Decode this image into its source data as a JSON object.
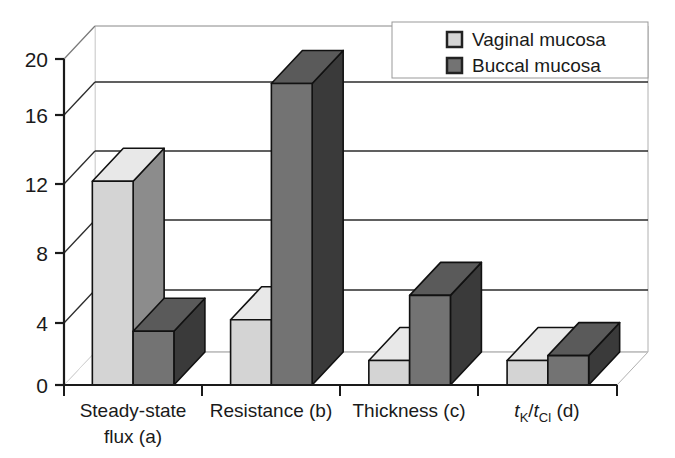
{
  "chart_data": {
    "type": "bar",
    "title": "",
    "subtitle": "",
    "xlabel": "",
    "ylabel": "",
    "ylim": [
      0,
      20
    ],
    "yticks": [
      0,
      4,
      8,
      12,
      16,
      20
    ],
    "ytick_labels": [
      "0",
      "4",
      "8",
      "12",
      "16",
      "20"
    ],
    "grid": true,
    "grid_axis": "y",
    "three_d": true,
    "legend_position": "top-right",
    "categories": [
      "Steady-state flux (a)",
      "Resistance (b)",
      "Thickness (c)",
      "tK/tCl (d)"
    ],
    "category_lines": [
      [
        "Steady-state",
        "flux (a)"
      ],
      [
        "Resistance (b)"
      ],
      [
        "Thickness (c)"
      ],
      [
        "tK/tCl (d)"
      ]
    ],
    "series": [
      {
        "name": "Vaginal mucosa",
        "color": "#d4d4d4",
        "side_color": "#8c8c8c",
        "top_color": "#e8e8e8",
        "values": [
          12.5,
          4.0,
          1.5,
          1.5
        ]
      },
      {
        "name": "Buccal mucosa",
        "color": "#737373",
        "side_color": "#3a3a3a",
        "top_color": "#5a5a5a",
        "values": [
          3.3,
          18.5,
          5.5,
          1.8
        ]
      }
    ]
  },
  "legend": {
    "items": [
      {
        "label": "Vaginal mucosa",
        "swatch_color": "#d4d4d4"
      },
      {
        "label": "Buccal mucosa",
        "swatch_color": "#737373"
      }
    ]
  },
  "axis": {
    "y_tick_labels": [
      "20",
      "16",
      "12",
      "8",
      "4",
      "0"
    ]
  },
  "category_labels": {
    "c0_line1": "Steady-state",
    "c0_line2": "flux (a)",
    "c1_line1": "Resistance (b)",
    "c2_line1": "Thickness (c)",
    "c3_t1": "t",
    "c3_sub1": "K",
    "c3_slash": "/",
    "c3_t2": "t",
    "c3_sub2": "Cl",
    "c3_tail": " (d)"
  },
  "colors": {
    "axis_line": "#1a1a1a",
    "grid_line": "#2b2b2b",
    "depth_line": "#b0b0b0",
    "legend_border": "#999999",
    "bar_outline": "#111111"
  }
}
